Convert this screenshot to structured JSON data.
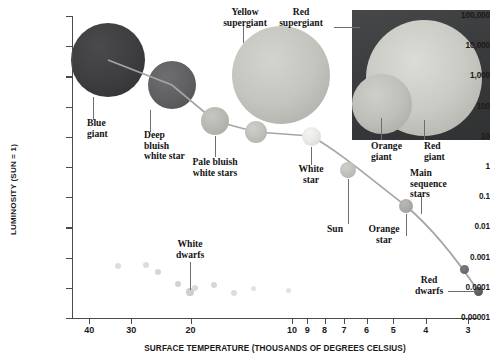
{
  "axes": {
    "y_title": "LUMINOSITY (SUN = 1)",
    "x_title": "SURFACE TEMPERATURE (THOUSANDS OF DEGREES CELSIUS)",
    "y_ticks": [
      "100,000",
      "10,000",
      "1,000",
      "100",
      "10",
      "1",
      "0.1",
      "0.01",
      "0.001",
      "0.0001",
      "0.00001"
    ],
    "x_ticks": [
      "40",
      "30",
      "20",
      "10",
      "9",
      "8",
      "7",
      "6",
      "5",
      "4",
      "3"
    ]
  },
  "labels": {
    "blue_giant": "Blue\ngiant",
    "deep_bluish_white_star": "Deep\nbluish\nwhite star",
    "yellow_supergiant": "Yellow\nsupergiant",
    "red_supergiant": "Red\nsupergiant",
    "pale_bluish_white_stars": "Pale bluish\nwhite stars",
    "white_star": "White\nstar",
    "orange_giant": "Orange\ngiant",
    "red_giant": "Red\ngiant",
    "sun": "Sun",
    "orange_star": "Orange\nstar",
    "main_sequence_stars": "Main\nsequence\nstars",
    "white_dwarfs": "White\ndwarfs",
    "red_dwarfs": "Red\ndwarfs"
  },
  "colors": {
    "axis": "#4a4a4a",
    "curve": "#9a9a9a",
    "leader": "#6e6e6e",
    "blue_giant": "#3c3c3e",
    "deep_bluish_white": "#5e5e60",
    "yellow_supergiant": "#c2c2bd",
    "red_supergiant": "#c9c9c4",
    "orange_giant": "#bdbdb8",
    "panel_dark": "#3a3b3d",
    "text": "#141414"
  },
  "chart_data": {
    "type": "scatter",
    "xlabel": "SURFACE TEMPERATURE (THOUSANDS OF DEGREES CELSIUS)",
    "ylabel": "LUMINOSITY (SUN = 1)",
    "xscale": "log-descending",
    "yscale": "log",
    "xlim": [
      45,
      2.8
    ],
    "ylim": [
      1e-05,
      100000
    ],
    "grid": false,
    "legend": "none",
    "x_tick_values": [
      40,
      30,
      20,
      10,
      9,
      8,
      7,
      6,
      5,
      4,
      3
    ],
    "y_tick_values": [
      100000,
      10000,
      1000,
      100,
      10,
      1,
      0.1,
      0.01,
      0.001,
      0.0001,
      1e-05
    ],
    "series": [
      {
        "name": "Main sequence stars",
        "type": "line-with-markers",
        "points": [
          {
            "label": "Blue giant",
            "temperature": 30,
            "luminosity": 5000,
            "px": 108,
            "py": 60,
            "r": 37,
            "color": "#3c3c3e"
          },
          {
            "label": "Deep bluish white star",
            "temperature": 18,
            "luminosity": 1000,
            "px": 172,
            "py": 85,
            "r": 24,
            "color": "#5e5e60"
          },
          {
            "label": "Pale bluish white stars",
            "temperature": 10,
            "luminosity": 30,
            "px": 215,
            "py": 121,
            "r": 14,
            "color": "#b4b4b0"
          },
          {
            "label": "Pale bluish white stars",
            "temperature": 8,
            "luminosity": 12,
            "px": 256,
            "py": 132,
            "r": 11,
            "color": "#bcbcb8"
          },
          {
            "label": "White star",
            "temperature": 6.3,
            "luminosity": 8,
            "px": 311,
            "py": 136,
            "r": 9.5,
            "color": "#e2e2de"
          },
          {
            "label": "Sun",
            "temperature": 5.5,
            "luminosity": 1,
            "px": 348,
            "py": 170,
            "r": 8,
            "color": "#bdbdb8"
          },
          {
            "label": "Orange star",
            "temperature": 4.3,
            "luminosity": 0.08,
            "px": 406,
            "py": 206,
            "r": 7,
            "color": "#a8a8a4"
          },
          {
            "label": "Red dwarfs",
            "temperature": 3.2,
            "luminosity": 0.0012,
            "px": 464,
            "py": 269,
            "r": 4.5,
            "color": "#6a6a6a"
          },
          {
            "label": "Red dwarfs",
            "temperature": 3.0,
            "luminosity": 0.0002,
            "px": 478,
            "py": 291,
            "r": 4.5,
            "color": "#5a5a5a"
          }
        ]
      },
      {
        "name": "Giants and supergiants",
        "type": "bubbles",
        "points": [
          {
            "label": "Yellow supergiant",
            "temperature": 7.5,
            "luminosity": 20000,
            "px": 281,
            "py": 75,
            "r": 49,
            "color": "#c2c2bd"
          },
          {
            "label": "Red supergiant",
            "temperature": 3.6,
            "luminosity": 30000,
            "px": 424,
            "py": 78,
            "r": 58,
            "color": "#c9c9c4"
          },
          {
            "label": "Orange giant",
            "temperature": 4.6,
            "luminosity": 300,
            "px": 382,
            "py": 104,
            "r": 30,
            "color": "#bdbdb8"
          }
        ]
      },
      {
        "name": "White dwarfs",
        "type": "scatter",
        "points": [
          {
            "px": 118,
            "py": 266,
            "r": 3.0,
            "luminosity": 0.001,
            "temperature": 30
          },
          {
            "px": 146,
            "py": 265,
            "r": 3.0,
            "luminosity": 0.001,
            "temperature": 20
          },
          {
            "px": 158,
            "py": 272,
            "r": 3.2,
            "luminosity": 0.0006,
            "temperature": 15
          },
          {
            "px": 178,
            "py": 284,
            "r": 3.4,
            "luminosity": 0.0002,
            "temperature": 10
          },
          {
            "px": 190,
            "py": 292,
            "r": 3.6,
            "luminosity": 0.00012,
            "temperature": 9.4
          },
          {
            "px": 195,
            "py": 288,
            "r": 3.0,
            "luminosity": 0.00016,
            "temperature": 9.2
          },
          {
            "px": 214,
            "py": 285,
            "r": 3.2,
            "luminosity": 0.00022,
            "temperature": 8.6
          },
          {
            "px": 234,
            "py": 293,
            "r": 3.0,
            "luminosity": 0.00011,
            "temperature": 8.0
          },
          {
            "px": 253,
            "py": 288,
            "r": 2.6,
            "luminosity": 0.00016,
            "temperature": 7.4
          },
          {
            "px": 288,
            "py": 290,
            "r": 2.6,
            "luminosity": 0.00013,
            "temperature": 6.4
          }
        ]
      }
    ],
    "annotations": [
      "Blue giant",
      "Deep bluish white star",
      "Yellow supergiant",
      "Red supergiant",
      "Pale bluish white stars",
      "White star",
      "Orange giant",
      "Red giant",
      "Sun",
      "Orange star",
      "Main sequence stars",
      "White dwarfs",
      "Red dwarfs"
    ]
  }
}
